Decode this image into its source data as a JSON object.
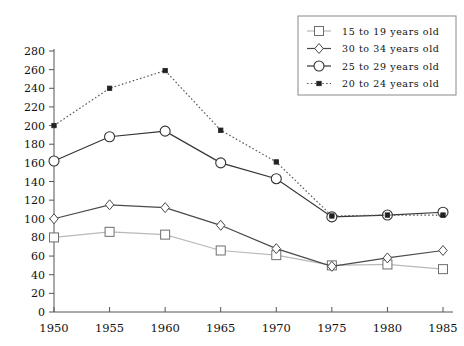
{
  "chart_data": {
    "type": "line",
    "title": "",
    "subtitle": "",
    "xlabel": "",
    "ylabel": "",
    "x": [
      1950,
      1955,
      1960,
      1965,
      1970,
      1975,
      1980,
      1985
    ],
    "categories": [
      "1950",
      "1955",
      "1960",
      "1965",
      "1970",
      "1975",
      "1980",
      "1985"
    ],
    "xlim": [
      1950,
      1985
    ],
    "ylim": [
      0,
      280
    ],
    "ytick_labels": [
      "0",
      "20",
      "40",
      "60",
      "80",
      "100",
      "120",
      "140",
      "160",
      "180",
      "200",
      "220",
      "240",
      "260",
      "280"
    ],
    "ytick_values": [
      0,
      20,
      40,
      60,
      80,
      100,
      120,
      140,
      160,
      180,
      200,
      220,
      240,
      260,
      280
    ],
    "xtick_labels": [
      "1950",
      "1955",
      "1960",
      "1965",
      "1970",
      "1975",
      "1980",
      "1985"
    ],
    "grid": false,
    "legend_position": "top-right",
    "series": [
      {
        "name": "15 to 19 years old",
        "marker": "open-square",
        "linestyle": "solid",
        "color": "#b9b9b9",
        "marker_color": "#6e6e6e",
        "values": [
          80,
          86,
          83,
          66,
          61,
          50,
          51,
          46
        ]
      },
      {
        "name": "30 to 34 years old",
        "marker": "open-diamond",
        "linestyle": "solid",
        "color": "#4a4a4a",
        "marker_color": "#4a4a4a",
        "values": [
          100,
          115,
          112,
          93,
          68,
          49,
          58,
          66
        ]
      },
      {
        "name": "25 to 29 years old",
        "marker": "open-circle",
        "linestyle": "solid",
        "color": "#333333",
        "marker_color": "#333333",
        "values": [
          162,
          188,
          194,
          160,
          143,
          102,
          104,
          107
        ]
      },
      {
        "name": "20 to 24 years old",
        "marker": "filled-square",
        "linestyle": "dotted",
        "color": "#5a5a5a",
        "marker_color": "#222222",
        "values": [
          200,
          240,
          259,
          195,
          161,
          103,
          104,
          104
        ]
      }
    ]
  },
  "legend": {
    "entries": [
      {
        "label": "15 to 19 years old"
      },
      {
        "label": "30 to 34 years old"
      },
      {
        "label": "25 to 29 years old"
      },
      {
        "label": "20 to 24 years old"
      }
    ]
  }
}
